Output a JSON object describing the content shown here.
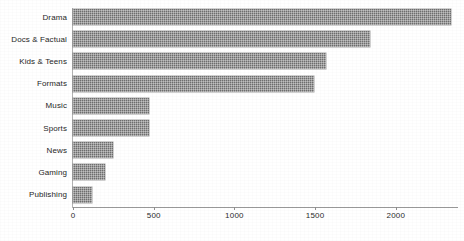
{
  "chart_data": {
    "type": "bar",
    "orientation": "horizontal",
    "title": "",
    "subtitle": "",
    "xlabel": "",
    "ylabel": "",
    "categories": [
      "Drama",
      "Docs & Factual",
      "Kids & Teens",
      "Formats",
      "Music",
      "Sports",
      "News",
      "Gaming",
      "Publishing"
    ],
    "values": [
      2340,
      1840,
      1570,
      1490,
      470,
      470,
      250,
      200,
      120
    ],
    "series": [
      {
        "name": "Hours",
        "values": [
          2340,
          1840,
          1570,
          1490,
          470,
          470,
          250,
          200,
          120
        ]
      }
    ],
    "xlim": [
      0,
      2385
    ],
    "xticks": [
      0,
      500,
      1000,
      1500,
      2000
    ],
    "xtick_labels": [
      "0",
      "500",
      "1000",
      "1500",
      "2000"
    ],
    "grid": false,
    "legend": false,
    "legend_position": "none",
    "bar_color": "#6e6e6e",
    "bar_fill_style": "dithered-gray-hatch",
    "background_color": "#ffffff",
    "axis_color": "#9a9a9a",
    "annotations": []
  },
  "axis": {
    "x_ticks": [
      {
        "label": "0",
        "value": 0
      },
      {
        "label": "500",
        "value": 500
      },
      {
        "label": "1000",
        "value": 1000
      },
      {
        "label": "1500",
        "value": 1500
      },
      {
        "label": "2000",
        "value": 2000
      }
    ]
  },
  "bars": [
    {
      "label": "Drama",
      "value": 2340
    },
    {
      "label": "Docs & Factual",
      "value": 1840
    },
    {
      "label": "Kids & Teens",
      "value": 1570
    },
    {
      "label": "Formats",
      "value": 1490
    },
    {
      "label": "Music",
      "value": 470
    },
    {
      "label": "Sports",
      "value": 470
    },
    {
      "label": "News",
      "value": 250
    },
    {
      "label": "Gaming",
      "value": 200
    },
    {
      "label": "Publishing",
      "value": 120
    }
  ]
}
